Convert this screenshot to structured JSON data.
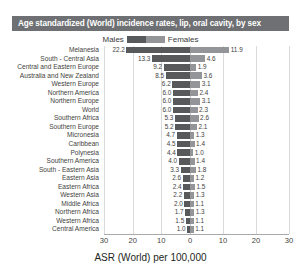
{
  "title": "Age standardized (World) incidence rates, lip, oral cavity, by sex",
  "legend": {
    "male_label": "Males",
    "female_label": "Females",
    "male_color": "#58595b",
    "female_color": "#939598"
  },
  "axis": {
    "title": "ASR (World) per 100,000",
    "ticks": [
      "30",
      "20",
      "10",
      "0",
      "10",
      "20",
      "30"
    ]
  },
  "chart_data": {
    "type": "bar",
    "title": "Age standardized (World) incidence rates, lip, oral cavity, by sex",
    "xlabel": "ASR (World) per 100,000",
    "ylabel": "",
    "orientation": "horizontal",
    "layout": "diverging-bidirectional",
    "grid": true,
    "legend_position": "top-center",
    "xlim": [
      -30,
      30
    ],
    "xticks": [
      -30,
      -20,
      -10,
      0,
      10,
      20,
      30
    ],
    "xtick_labels": [
      "30",
      "20",
      "10",
      "0",
      "10",
      "20",
      "30"
    ],
    "categories": [
      "Melanesia",
      "South - Central Asia",
      "Central and Eastern Europe",
      "Australia and New Zealand",
      "Western Europe",
      "Northern America",
      "Northern Europe",
      "World",
      "Southern Africa",
      "Southern Europe",
      "Micronesia",
      "Caribbean",
      "Polynesia",
      "Southern America",
      "South - Eastern Asia",
      "Eastern Asia",
      "Eastern Africa",
      "Western Asia",
      "Middle Africa",
      "Northern Africa",
      "Western Africa",
      "Central America"
    ],
    "series": [
      {
        "name": "Males",
        "direction": "left",
        "color": "#58595b",
        "values": [
          22.2,
          13.3,
          9.2,
          8.5,
          6.2,
          6.0,
          6.0,
          6.0,
          5.3,
          5.2,
          4.7,
          4.5,
          4.4,
          4.0,
          3.3,
          2.6,
          2.4,
          2.2,
          2.0,
          1.7,
          1.5,
          1.0
        ]
      },
      {
        "name": "Females",
        "direction": "right",
        "color": "#939598",
        "values": [
          11.9,
          4.6,
          1.9,
          3.6,
          3.1,
          2.4,
          3.1,
          2.3,
          2.6,
          2.1,
          1.3,
          1.4,
          1.0,
          1.4,
          1.8,
          1.2,
          1.5,
          1.3,
          1.1,
          1.3,
          1.1,
          1.1
        ]
      }
    ]
  }
}
